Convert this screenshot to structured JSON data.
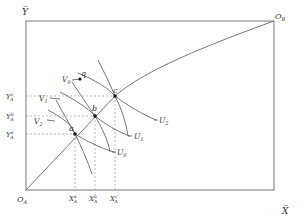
{
  "diagram": {
    "type": "edgeworth-box",
    "colors": {
      "axis": "#777777",
      "curve": "#666666",
      "dashed": "#aaaaaa",
      "text": "#333333"
    },
    "labels": {
      "y_bar": "Y̅",
      "x_bar": "X̅",
      "origin_a": "O",
      "origin_a_sub": "A",
      "origin_b": "O",
      "origin_b_sub": "B"
    },
    "points": {
      "a": "a",
      "b": "b",
      "c": "c",
      "q": "q"
    },
    "a_curves": [
      {
        "name": "U",
        "sub": "0"
      },
      {
        "name": "U",
        "sub": "1"
      },
      {
        "name": "U",
        "sub": "2"
      }
    ],
    "b_curves": [
      {
        "name": "V",
        "sub": "0"
      },
      {
        "name": "V",
        "sub": "1"
      },
      {
        "name": "V",
        "sub": "2"
      }
    ],
    "y_ticks": [
      {
        "main": "Y",
        "sup": "c",
        "sub": "A"
      },
      {
        "main": "Y",
        "sup": "b",
        "sub": "A"
      },
      {
        "main": "Y",
        "sup": "a",
        "sub": "A"
      }
    ],
    "x_ticks": [
      {
        "main": "X",
        "sup": "a",
        "sub": "A"
      },
      {
        "main": "X",
        "sup": "b",
        "sub": "A"
      },
      {
        "main": "X",
        "sup": "c",
        "sub": "A"
      }
    ]
  }
}
